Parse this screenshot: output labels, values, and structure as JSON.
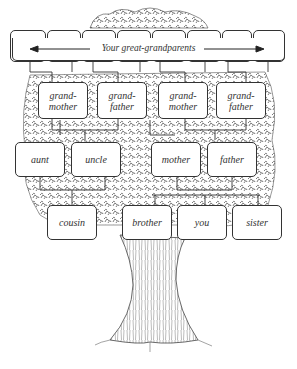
{
  "diagram": {
    "type": "family-tree",
    "style": "pen-and-ink illustrated tree with labeled boxes",
    "colors": {
      "ink": "#333333",
      "foliage": "#555555",
      "background": "#ffffff",
      "box_fill": "#ffffff"
    },
    "great_grandparents": {
      "label": "Your great-grandparents",
      "box_count": 8,
      "arrow": "double-headed horizontal arrow spanning the row"
    },
    "grandparents": [
      {
        "line1": "grand-",
        "line2": "mother"
      },
      {
        "line1": "grand-",
        "line2": "father"
      },
      {
        "line1": "grand-",
        "line2": "mother"
      },
      {
        "line1": "grand-",
        "line2": "father"
      }
    ],
    "parents_generation": [
      {
        "label": "aunt"
      },
      {
        "label": "uncle"
      },
      {
        "label": "mother"
      },
      {
        "label": "father"
      }
    ],
    "your_generation": [
      {
        "label": "cousin"
      },
      {
        "label": "brother"
      },
      {
        "label": "you"
      },
      {
        "label": "sister"
      }
    ]
  }
}
